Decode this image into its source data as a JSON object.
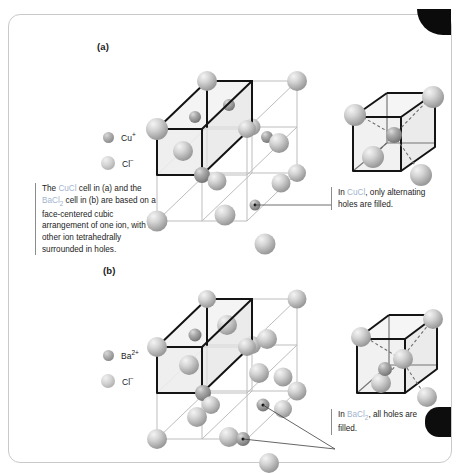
{
  "figure": {
    "panels": [
      {
        "id": "a",
        "label": "(a)",
        "compound": "CuCl"
      },
      {
        "id": "b",
        "label": "(b)",
        "compound": "BaCl2"
      }
    ]
  },
  "legend_a": {
    "items": [
      {
        "icon": "sphere-cation-icon",
        "label_main": "Cu",
        "label_sup": "+",
        "color": "#9a9a9a",
        "role": "cation"
      },
      {
        "icon": "sphere-anion-icon",
        "label_main": "Cl",
        "label_sup": "−",
        "color": "#cfcfcf",
        "role": "anion"
      }
    ]
  },
  "legend_b": {
    "items": [
      {
        "icon": "sphere-cation-icon",
        "label_main": "Ba",
        "label_sup": "2+",
        "color": "#9a9a9a",
        "role": "cation"
      },
      {
        "icon": "sphere-anion-icon",
        "label_main": "Cl",
        "label_sup": "−",
        "color": "#cfcfcf",
        "role": "anion"
      }
    ]
  },
  "notes": {
    "main_part1": "The ",
    "main_hl1": "CuCl",
    "main_part2": " cell in (a) and the ",
    "main_hl2_base": "BaCl",
    "main_hl2_sub": "2",
    "main_part3": " cell in (b) are based on a face-centered cubic arrangement of one ion, with the other ion tetrahedrally surrounded in holes.",
    "a_part1": "In ",
    "a_hl": "CuCl",
    "a_part2": ", only alternating holes are filled.",
    "b_part1": "In ",
    "b_hl_base": "BaCl",
    "b_hl_sub": "2",
    "b_part2": ", all holes are filled."
  },
  "colors": {
    "highlight_text": "#9fb4cf",
    "body_text": "#232323",
    "cell_edge_bold": "#141414",
    "cell_edge_light": "#b8b8b8",
    "face_tint": "#e9e9e9",
    "page_border": "#c9c9c9",
    "tab_black": "#0b0b0b"
  },
  "structure_a": {
    "type": "fcc-with-alternating-tetrahedral-holes",
    "anion_lattice": "face-centered cubic Cl-",
    "filled_holes": 4,
    "total_holes": 8,
    "highlighted_octant": true
  },
  "structure_b": {
    "type": "fluorite-all-tetrahedral-holes-filled",
    "cation_lattice": "face-centered cubic Ba2+",
    "filled_holes": 8,
    "total_holes": 8,
    "highlighted_octant": true
  },
  "inset_a": {
    "caption_ref": "a",
    "corner_spheres": 4,
    "center_sphere": 1,
    "dashed_bonds": 4
  },
  "inset_b": {
    "caption_ref": "b",
    "corner_spheres": 4,
    "center_spheres": 2,
    "dashed_bonds": 4
  }
}
